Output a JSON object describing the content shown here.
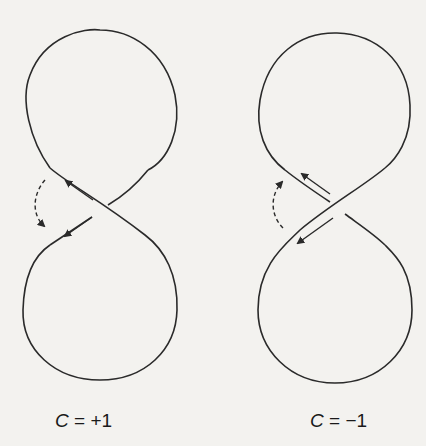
{
  "figure": {
    "colors": {
      "background": "#f3f2ef",
      "stroke": "#2a2a2a"
    },
    "panels": [
      {
        "id": "left",
        "crossing_type": "positive",
        "over_strand": "upper-left to lower-right",
        "caption_var": "C",
        "caption_rest": " = +1"
      },
      {
        "id": "right",
        "crossing_type": "negative",
        "over_strand": "upper-right to lower-left",
        "caption_var": "C",
        "caption_rest": " = −1"
      }
    ]
  }
}
